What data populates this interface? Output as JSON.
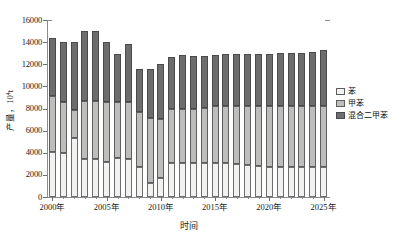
{
  "chart_data": {
    "type": "bar",
    "subtype": "stacked-vertical",
    "title": "",
    "xlabel": "时间",
    "ylabel": "产量，10⁴t",
    "ylim": [
      0,
      16000
    ],
    "ytick_values": [
      0,
      2000,
      4000,
      6000,
      8000,
      10000,
      12000,
      14000,
      16000
    ],
    "ytick_labels": [
      "0",
      "2000",
      "4000",
      "6000",
      "8000",
      "10000",
      "12000",
      "14000",
      "16000"
    ],
    "grid": false,
    "legend_position": "right",
    "categories": [
      "2000",
      "2001",
      "2002",
      "2003",
      "2004",
      "2005",
      "2006",
      "2007",
      "2008",
      "2009",
      "2010",
      "2011",
      "2012",
      "2013",
      "2014",
      "2015",
      "2016",
      "2017",
      "2018",
      "2019",
      "2020",
      "2021",
      "2022",
      "2023",
      "2024",
      "2025"
    ],
    "xtick_labels": [
      "2000年",
      "2005年",
      "2010年",
      "2015年",
      "2020年",
      "2025年"
    ],
    "xtick_categories": [
      "2000",
      "2005",
      "2010",
      "2015",
      "2020",
      "2025"
    ],
    "series": [
      {
        "name": "苯",
        "color": "#f2f2f0",
        "values": [
          4050,
          4000,
          5350,
          3450,
          3450,
          3150,
          3550,
          3450,
          2700,
          1300,
          1700,
          3100,
          3100,
          3100,
          3100,
          3050,
          3050,
          3000,
          2900,
          2800,
          2750,
          2750,
          2700,
          2700,
          2700,
          2700
        ]
      },
      {
        "name": "甲苯",
        "color": "#bdbdbb",
        "values": [
          5100,
          4600,
          2500,
          5200,
          5250,
          5450,
          5050,
          5150,
          5000,
          5800,
          5350,
          4850,
          4850,
          4900,
          4950,
          5150,
          5200,
          5200,
          5300,
          5400,
          5450,
          5450,
          5500,
          5500,
          5500,
          5500
        ]
      },
      {
        "name": "混合二甲苯",
        "color": "#6d6d6d",
        "values": [
          5250,
          5400,
          6150,
          6350,
          6300,
          5400,
          4300,
          5250,
          3900,
          4500,
          5000,
          4750,
          4850,
          4750,
          4700,
          4650,
          4650,
          4700,
          4750,
          4750,
          4750,
          4800,
          4800,
          4800,
          4900,
          5100
        ]
      }
    ],
    "totals": [
      14400,
      14000,
      14000,
      15000,
      15000,
      14000,
      12900,
      13850,
      11600,
      11600,
      12050,
      12700,
      12800,
      12750,
      12750,
      12850,
      12900,
      12900,
      12950,
      12950,
      12950,
      13000,
      13000,
      13000,
      13100,
      13300
    ]
  },
  "legend": {
    "items": [
      {
        "label": "苯",
        "color": "#f2f2f0"
      },
      {
        "label": "甲苯",
        "color": "#bdbdbb"
      },
      {
        "label": "混合二甲苯",
        "color": "#6d6d6d"
      }
    ]
  },
  "axes": {
    "y_title": "产量，10⁴t",
    "x_title": "时间"
  }
}
